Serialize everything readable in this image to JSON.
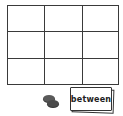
{
  "board": {
    "rows": 3,
    "cols": 3,
    "cells": [
      [
        "",
        "",
        ""
      ],
      [
        "",
        "",
        ""
      ],
      [
        "",
        "",
        ""
      ]
    ]
  },
  "pieces": {
    "coins": {
      "count": 2,
      "icon": "coin-stack-icon",
      "color": "#555555"
    }
  },
  "card": {
    "word": "between"
  },
  "colors": {
    "grid_line": "#3a3a3a",
    "background": "#ffffff"
  }
}
